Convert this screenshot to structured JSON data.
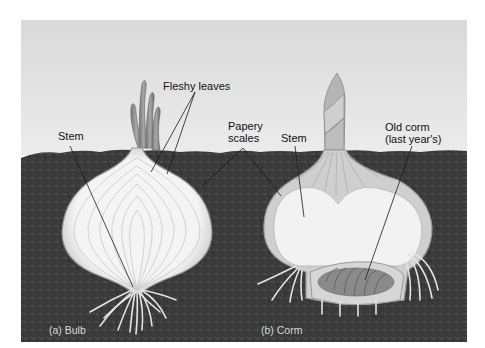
{
  "figure": {
    "panels": [
      {
        "id": "a",
        "caption": "(a) Bulb"
      },
      {
        "id": "b",
        "caption": "(b) Corm"
      }
    ],
    "labels": {
      "fleshy_leaves": "Fleshy leaves",
      "stem_bulb": "Stem",
      "papery_scales_line1": "Papery",
      "papery_scales_line2": "scales",
      "stem_corm": "Stem",
      "old_corm_line1": "Old corm",
      "old_corm_line2": "(last year's)"
    },
    "colors": {
      "sky": "#e2e2e2",
      "soil": "#3b3b3b",
      "bulb_flesh": "#f2f2f2",
      "bulb_outline": "#a9a9a9",
      "shoot": "#8e8e8e",
      "root": "#e6e6e6",
      "leader_line": "#222222"
    }
  }
}
